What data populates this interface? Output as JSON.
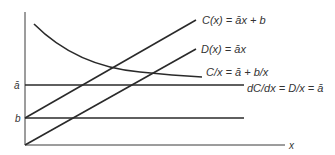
{
  "diagram": {
    "colors": {
      "stroke": "#2a2a2a",
      "axis": "#3a3a3a",
      "text": "#333333",
      "background": "#ffffff"
    },
    "axes": {
      "x_label": "x",
      "y_ticks": [
        {
          "label": "ā",
          "name": "a-bar"
        },
        {
          "label": "b",
          "name": "b"
        }
      ]
    },
    "curves": {
      "total_cost": {
        "label": "C(x) = āx + b"
      },
      "variable_cost": {
        "label": "D(x) = āx"
      },
      "average_cost": {
        "label": "C/x = ā + b/x"
      },
      "marginal_cost": {
        "label": "dC/dx = D/x = ā"
      }
    }
  }
}
